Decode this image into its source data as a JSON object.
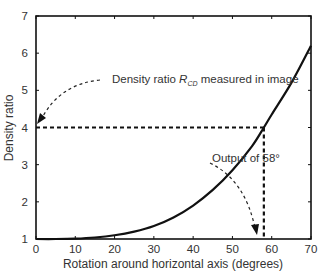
{
  "chart_data": {
    "type": "line",
    "title": "",
    "xlabel": "Rotation around horizontal axis (degrees)",
    "ylabel": "Density ratio",
    "xlim": [
      0,
      70
    ],
    "ylim": [
      1,
      7
    ],
    "xticks": [
      0,
      10,
      20,
      30,
      40,
      50,
      60,
      70
    ],
    "yticks": [
      1,
      2,
      3,
      4,
      5,
      6,
      7
    ],
    "grid": false,
    "legend": null,
    "series": [
      {
        "name": "Density ratio vs rotation",
        "x": [
          0,
          5,
          10,
          15,
          20,
          25,
          30,
          35,
          40,
          45,
          50,
          55,
          58,
          60,
          65,
          70
        ],
        "y": [
          1.0,
          1.0,
          1.01,
          1.04,
          1.1,
          1.2,
          1.35,
          1.58,
          1.9,
          2.32,
          2.85,
          3.5,
          4.0,
          4.35,
          5.2,
          6.2
        ]
      }
    ],
    "reference_lines": [
      {
        "type": "horizontal",
        "y": 4,
        "x_from": 0,
        "x_to": 58,
        "style": "dashed"
      },
      {
        "type": "vertical",
        "x": 58,
        "y_from": 4,
        "y_to": 1,
        "style": "dashed"
      }
    ],
    "annotations": [
      {
        "text_prefix": "Density ratio ",
        "symbol": "R",
        "subscript": "CD",
        "text_suffix": " measured in image",
        "arrow_to": [
          0,
          4
        ]
      },
      {
        "text": "Output of 58°",
        "arrow_to": [
          56.5,
          1.15
        ]
      }
    ]
  },
  "labels": {
    "xlabel": "Rotation around horizontal axis (degrees)",
    "ylabel": "Density ratio",
    "annotation1_prefix": "Density ratio ",
    "annotation1_symbol": "R",
    "annotation1_sub": "CD",
    "annotation1_suffix": " measured in image",
    "annotation2": "Output of 58°"
  }
}
